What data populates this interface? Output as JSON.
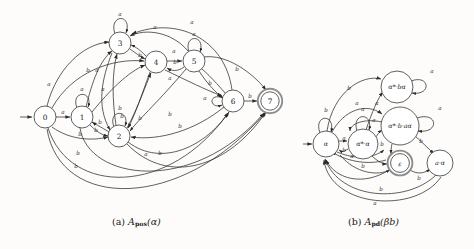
{
  "figure": {
    "kind": "two-panel-automata-figure",
    "background": "#fdfcfa",
    "ink": "#2b2b2b",
    "accent_ring": "#8d8d8d"
  },
  "captions": {
    "left": {
      "tag": "(a)",
      "name": "A",
      "sub": "pos",
      "arg": "(α)"
    },
    "right": {
      "tag": "(b)",
      "name": "A",
      "sub": "pd",
      "arg": "(βb)"
    }
  },
  "panel_a": {
    "title": "A_pos(alpha)",
    "start_state": "0",
    "accepting_states": [
      "7"
    ],
    "states": [
      {
        "id": "0",
        "label": "0",
        "cx": 45,
        "cy": 117,
        "r": 11
      },
      {
        "id": "1",
        "label": "1",
        "cx": 82,
        "cy": 117,
        "r": 11
      },
      {
        "id": "2",
        "label": "2",
        "cx": 119,
        "cy": 136,
        "r": 11
      },
      {
        "id": "3",
        "label": "3",
        "cx": 120,
        "cy": 43,
        "r": 11
      },
      {
        "id": "4",
        "label": "4",
        "cx": 156,
        "cy": 62,
        "r": 11
      },
      {
        "id": "5",
        "label": "5",
        "cx": 194,
        "cy": 61,
        "r": 11
      },
      {
        "id": "6",
        "label": "6",
        "cx": 233,
        "cy": 101,
        "r": 11
      },
      {
        "id": "7",
        "label": "7",
        "cx": 270,
        "cy": 101,
        "r": 11
      }
    ],
    "self_loops": [
      {
        "state": "3",
        "symbol": "a"
      },
      {
        "state": "1",
        "symbol": "a"
      },
      {
        "state": "2",
        "symbol": "b"
      },
      {
        "state": "5",
        "symbol": "a"
      },
      {
        "state": "6",
        "symbol": "a"
      }
    ],
    "edge_labels": [
      "a",
      "b",
      "a",
      "b",
      "a",
      "b",
      "a",
      "b",
      "a",
      "b",
      "a",
      "b",
      "b",
      "b",
      "b",
      "b",
      "a",
      "a",
      "b",
      "b",
      "a",
      "b",
      "b",
      "b",
      "b"
    ],
    "alphabet": [
      "a",
      "b"
    ]
  },
  "panel_b": {
    "title": "A_pd(beta b)",
    "start_state": "alpha",
    "accepting_states": [
      "epsilon"
    ],
    "states": [
      {
        "id": "alpha",
        "label": "α",
        "cx": 326,
        "cy": 144,
        "r": 13
      },
      {
        "id": "astar_a",
        "label": "α*·α",
        "cx": 363,
        "cy": 144,
        "r": 15
      },
      {
        "id": "astar_ba",
        "label": "α*·bα",
        "cx": 397,
        "cy": 87,
        "r": 16
      },
      {
        "id": "astar_baa",
        "label": "α*·b·aα",
        "cx": 400,
        "cy": 126,
        "r": 19
      },
      {
        "id": "epsilon",
        "label": "ε",
        "cx": 400,
        "cy": 163,
        "r": 12
      },
      {
        "id": "a_alpha",
        "label": "a·α",
        "cx": 440,
        "cy": 163,
        "r": 13
      }
    ],
    "self_loops": [
      {
        "state": "alpha",
        "symbol": "b"
      },
      {
        "state": "astar_a",
        "symbol": "a"
      },
      {
        "state": "astar_ba",
        "symbol": "a"
      },
      {
        "state": "astar_baa",
        "symbol": "a"
      }
    ],
    "edge_labels": [
      "b",
      "a",
      "a",
      "a",
      "b",
      "a",
      "b",
      "b",
      "b",
      "b",
      "a"
    ],
    "alphabet": [
      "a",
      "b"
    ]
  }
}
